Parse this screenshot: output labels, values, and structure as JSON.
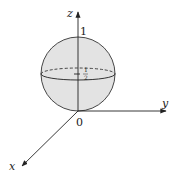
{
  "diagram": {
    "axes": {
      "x_label": "x",
      "y_label": "y",
      "z_label": "z",
      "origin_label": "0"
    },
    "ticks": {
      "z_one": "1",
      "z_half_num": "1",
      "z_half_den": "2"
    },
    "sphere": {
      "fill_color": "#e3e3e3",
      "stroke_color": "#333333",
      "equator_style": "front solid, back dashed"
    },
    "colors": {
      "axis": "#222222",
      "background": "#ffffff"
    }
  }
}
